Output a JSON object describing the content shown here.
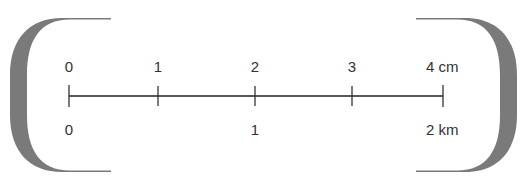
{
  "diagram": {
    "type": "scale-bar",
    "top_labels": [
      "0",
      "1",
      "2",
      "3",
      "4 cm"
    ],
    "bottom_labels": [
      "0",
      "1",
      "2 km"
    ],
    "top_unit": "cm",
    "bottom_unit": "km",
    "colors": {
      "bracket": "#7a7a7a",
      "line": "#222222",
      "text": "#333333"
    }
  }
}
